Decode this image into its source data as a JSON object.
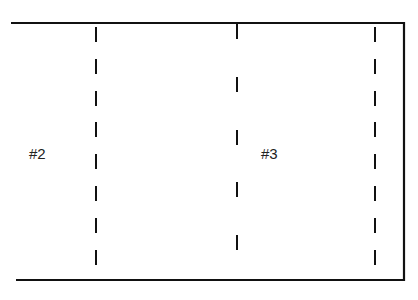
{
  "diagram": {
    "type": "panel-layout",
    "panels": [
      {
        "id": "panel-2",
        "label": "#2"
      },
      {
        "id": "panel-3",
        "label": "#3"
      }
    ],
    "divider_lines": [
      {
        "name": "left-fold-line",
        "style": "dashed"
      },
      {
        "name": "center-fold-line",
        "style": "dashed"
      },
      {
        "name": "right-fold-line",
        "style": "dashed"
      }
    ],
    "colors": {
      "line": "#111111",
      "text": "#222222",
      "background": "#ffffff"
    }
  }
}
